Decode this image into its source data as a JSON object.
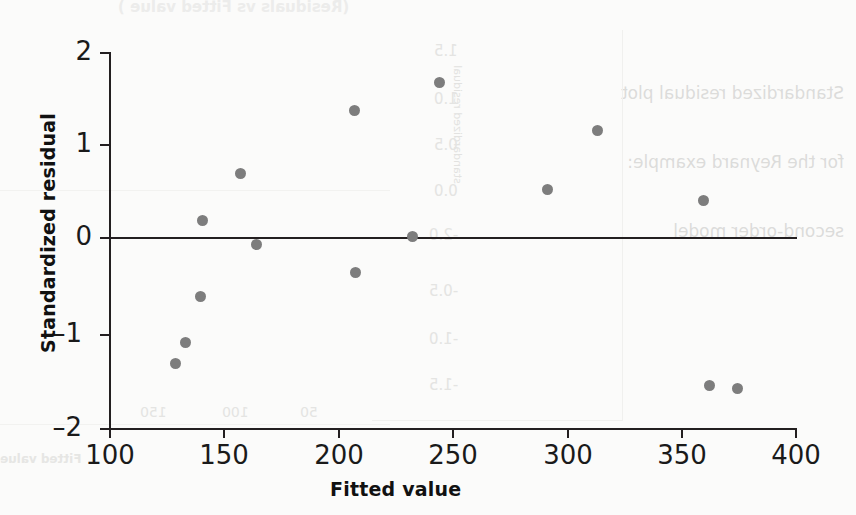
{
  "chart_data": {
    "type": "scatter",
    "title": "",
    "xlabel": "Fitted value",
    "ylabel": "Standardized residual",
    "xlim": [
      100,
      400
    ],
    "ylim": [
      -2,
      2
    ],
    "xticks": [
      100,
      150,
      200,
      250,
      300,
      350,
      400
    ],
    "yticks": [
      2,
      1,
      0,
      -1,
      -2
    ],
    "grid": false,
    "legend": null,
    "reference_line": {
      "y": 0,
      "style": "solid",
      "color": "#231f20"
    },
    "marker": {
      "shape": "circle",
      "color": "#7d7d7d",
      "size": 11
    },
    "points": [
      {
        "x": 128.5,
        "y": -1.31
      },
      {
        "x": 133.0,
        "y": -1.09
      },
      {
        "x": 139.5,
        "y": -0.6
      },
      {
        "x": 140.5,
        "y": 0.21
      },
      {
        "x": 157.0,
        "y": 0.71
      },
      {
        "x": 164.0,
        "y": -0.05
      },
      {
        "x": 207.0,
        "y": 1.38
      },
      {
        "x": 207.5,
        "y": -0.35
      },
      {
        "x": 232.5,
        "y": 0.04
      },
      {
        "x": 244.5,
        "y": 1.68
      },
      {
        "x": 291.5,
        "y": 0.54
      },
      {
        "x": 313.5,
        "y": 1.17
      },
      {
        "x": 360.0,
        "y": 0.42
      },
      {
        "x": 362.5,
        "y": -1.55
      },
      {
        "x": 375.0,
        "y": -1.58
      }
    ]
  },
  "axis": {
    "y_label": "Standardized residual",
    "x_label": "Fitted value",
    "y_tick_labels": [
      "2",
      "1",
      "0",
      "–1",
      "–2"
    ],
    "x_tick_labels": [
      "100",
      "150",
      "200",
      "250",
      "300",
      "350",
      "400"
    ]
  },
  "bleed_through": {
    "top_title": "(Residuals vs Fitted value )",
    "caption_lines": [
      "Standardized residual plot",
      "for the Reynard example:",
      "second-order model"
    ],
    "y_axis_label": "standardized residual",
    "y_tick_labels": [
      "1.5",
      "1.0",
      "0.5",
      "0.0",
      "-0.5",
      "-1.0",
      "-1.5",
      "-2.0"
    ],
    "x_tick_labels": [
      "50",
      "100",
      "150"
    ],
    "x_axis_label": "Fitted value"
  },
  "colors": {
    "marker": "#7d7d7d",
    "axis": "#231f20",
    "background": "#fbfbfa",
    "bleed": "#dcdcda"
  }
}
